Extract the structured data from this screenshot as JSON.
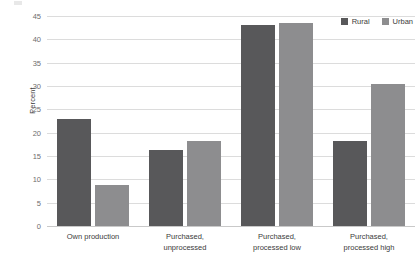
{
  "chart_data": {
    "type": "bar",
    "title": "",
    "subtitle": "",
    "xlabel": "",
    "ylabel": "Percent",
    "ylim": [
      0,
      45
    ],
    "ytick_step": 5,
    "yticks": [
      0,
      5,
      10,
      15,
      20,
      25,
      30,
      35,
      40,
      45
    ],
    "ytick_labels": [
      "0",
      "5",
      "10",
      "15",
      "20",
      "25",
      "30",
      "35",
      "40",
      "45"
    ],
    "grid": true,
    "legend_position": "top-right",
    "categories": [
      "Own production",
      "Purchased, unprocessed",
      "Purchased, processed low",
      "Purchased, processed high"
    ],
    "category_lines": [
      [
        "Own production",
        ""
      ],
      [
        "Purchased,",
        "unprocessed"
      ],
      [
        "Purchased,",
        "processed low"
      ],
      [
        "Purchased,",
        "processed high"
      ]
    ],
    "series": [
      {
        "name": "Rural",
        "color": "#58585a",
        "values": [
          23.0,
          16.3,
          43.0,
          18.3
        ]
      },
      {
        "name": "Urban",
        "color": "#8d8d8f",
        "values": [
          8.8,
          18.2,
          43.6,
          30.4
        ]
      }
    ]
  },
  "legend": {
    "items": [
      {
        "label": "Rural",
        "color": "#58585a"
      },
      {
        "label": "Urban",
        "color": "#8d8d8f"
      }
    ]
  },
  "axis": {
    "y_title": "Percent"
  },
  "colors": {
    "rural": "#58585a",
    "urban": "#8d8d8f",
    "gridline": "#dcdcdc",
    "baseline": "#c9c9c9",
    "text": "#3b3b3b",
    "tick_text": "#6d6d6d",
    "background": "#ffffff"
  }
}
